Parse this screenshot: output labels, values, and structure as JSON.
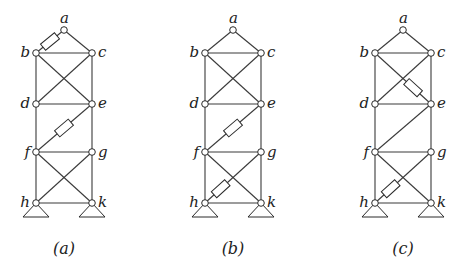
{
  "figure": {
    "node_names": [
      "a",
      "b",
      "c",
      "d",
      "e",
      "f",
      "g",
      "h",
      "k"
    ],
    "panels": [
      {
        "caption": "(a)",
        "offset_x": 0,
        "highlighted_members": [
          [
            "a",
            "b"
          ],
          [
            "e",
            "f"
          ]
        ]
      },
      {
        "caption": "(b)",
        "offset_x": 169,
        "highlighted_members": [
          [
            "e",
            "f"
          ],
          [
            "h",
            "g"
          ]
        ]
      },
      {
        "caption": "(c)",
        "offset_x": 339,
        "highlighted_members": [
          [
            "b",
            "e"
          ],
          [
            "h",
            "g"
          ]
        ]
      }
    ],
    "members": [
      [
        "a",
        "b"
      ],
      [
        "a",
        "c"
      ],
      [
        "b",
        "c"
      ],
      [
        "b",
        "d"
      ],
      [
        "c",
        "e"
      ],
      [
        "b",
        "e"
      ],
      [
        "c",
        "d"
      ],
      [
        "d",
        "e"
      ],
      [
        "d",
        "f"
      ],
      [
        "e",
        "g"
      ],
      [
        "e",
        "f"
      ],
      [
        "f",
        "g"
      ],
      [
        "f",
        "h"
      ],
      [
        "g",
        "k"
      ],
      [
        "f",
        "k"
      ],
      [
        "g",
        "h"
      ],
      [
        "h",
        "k"
      ]
    ],
    "node_positions": {
      "a": [
        64,
        30
      ],
      "b": [
        36,
        53
      ],
      "c": [
        92,
        53
      ],
      "d": [
        36,
        104
      ],
      "e": [
        92,
        104
      ],
      "f": [
        36,
        152
      ],
      "g": [
        92,
        152
      ],
      "h": [
        36,
        203
      ],
      "k": [
        92,
        203
      ]
    },
    "label_positions": {
      "a": [
        60,
        23,
        "start"
      ],
      "b": [
        30,
        57,
        "end"
      ],
      "c": [
        98,
        57,
        "start"
      ],
      "d": [
        30,
        108,
        "end"
      ],
      "e": [
        98,
        108,
        "start"
      ],
      "f": [
        30,
        157,
        "end"
      ],
      "g": [
        98,
        157,
        "start"
      ],
      "h": [
        30,
        207,
        "end"
      ],
      "k": [
        98,
        207,
        "start"
      ]
    },
    "supports": [
      "h",
      "k"
    ],
    "caption_y": 254
  }
}
